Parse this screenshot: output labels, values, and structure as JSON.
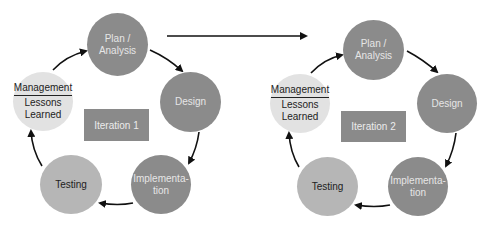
{
  "diagram": {
    "colors": {
      "dark_node": "#8b8b8b",
      "mid_node": "#b6b6b6",
      "light_node": "#e2e2e2",
      "iteration_box": "#8a8a8a",
      "arrow": "#111111"
    },
    "iterations": [
      {
        "label": "Iteration 1",
        "nodes": {
          "plan": {
            "line1": "Plan /",
            "line2": "Analysis"
          },
          "design": {
            "label": "Design"
          },
          "implementation": {
            "line1": "Implementa-",
            "line2": "tion"
          },
          "testing": {
            "label": "Testing"
          },
          "management": {
            "line1": "Management",
            "line2": "Lessons",
            "line3": "Learned"
          }
        }
      },
      {
        "label": "Iteration 2",
        "nodes": {
          "plan": {
            "line1": "Plan /",
            "line2": "Analysis"
          },
          "design": {
            "label": "Design"
          },
          "implementation": {
            "line1": "Implementa-",
            "line2": "tion"
          },
          "testing": {
            "label": "Testing"
          },
          "management": {
            "line1": "Management",
            "line2": "Lessons",
            "line3": "Learned"
          }
        }
      }
    ],
    "flow": [
      "Plan / Analysis",
      "Design",
      "Implementation",
      "Testing",
      "Management / Lessons Learned"
    ]
  }
}
